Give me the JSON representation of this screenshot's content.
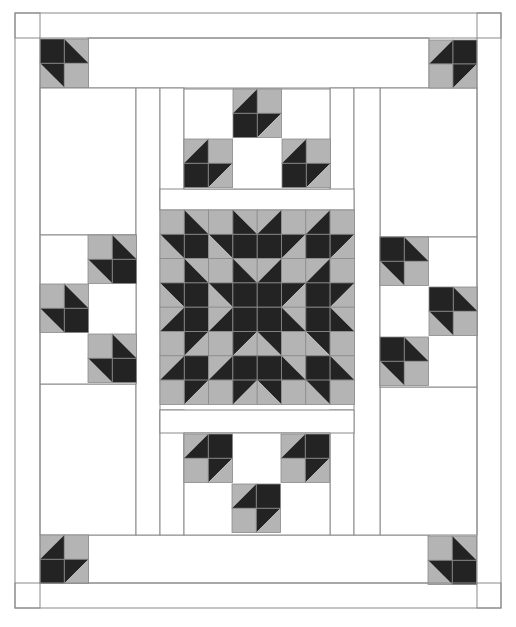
{
  "colors": {
    "background": "#ffffff",
    "fabric_light": "#ffffff",
    "fabric_gray": "#b4b4b4",
    "fabric_dark": "#232323",
    "seam_line": "#8a8a8a"
  },
  "cell_size": 24.3,
  "outline": {
    "outer_border": [
      15,
      13,
      486,
      595
    ],
    "inner_border": [
      40,
      38,
      437,
      545
    ]
  },
  "panels": [
    {
      "name": "top-sashing",
      "rect": [
        88,
        38,
        341,
        50
      ]
    },
    {
      "name": "bottom-sashing",
      "rect": [
        88,
        535,
        341,
        48
      ]
    },
    {
      "name": "left-top-panel",
      "rect": [
        40,
        88,
        96,
        147
      ]
    },
    {
      "name": "left-bottom-panel",
      "rect": [
        40,
        384,
        96,
        151
      ]
    },
    {
      "name": "right-top-panel",
      "rect": [
        380,
        88,
        97,
        149
      ]
    },
    {
      "name": "right-bottom-panel",
      "rect": [
        380,
        387,
        97,
        148
      ]
    },
    {
      "name": "left-strip-outer",
      "rect": [
        136,
        88,
        24,
        447
      ]
    },
    {
      "name": "left-strip-inner",
      "rect": [
        160,
        88,
        24,
        122
      ]
    },
    {
      "name": "left-strip-inner-bottom",
      "rect": [
        160,
        410,
        24,
        125
      ]
    },
    {
      "name": "right-strip-inner",
      "rect": [
        330,
        88,
        24,
        122
      ]
    },
    {
      "name": "right-strip-inner-bottom",
      "rect": [
        330,
        410,
        24,
        125
      ]
    },
    {
      "name": "right-strip-outer",
      "rect": [
        354,
        88,
        26,
        447
      ]
    },
    {
      "name": "top-center-strip",
      "rect": [
        160,
        189,
        194,
        21
      ]
    },
    {
      "name": "bottom-center-strip",
      "rect": [
        160,
        410,
        194,
        23
      ]
    },
    {
      "name": "top-center-field",
      "rect": [
        184,
        89,
        146,
        100
      ]
    },
    {
      "name": "bottom-center-field",
      "rect": [
        184,
        433,
        146,
        102
      ]
    },
    {
      "name": "left-center-field",
      "rect": [
        40,
        235,
        96,
        149
      ]
    },
    {
      "name": "right-center-field",
      "rect": [
        380,
        237,
        97,
        150
      ]
    },
    {
      "name": "left-corner-top",
      "rect": [
        15,
        13,
        25,
        25
      ]
    },
    {
      "name": "left-corner-bottom",
      "rect": [
        15,
        583,
        25,
        25
      ]
    },
    {
      "name": "right-corner-top",
      "rect": [
        477,
        13,
        24,
        25
      ]
    },
    {
      "name": "right-corner-bottom",
      "rect": [
        477,
        583,
        24,
        25
      ]
    }
  ],
  "bird_blocks": [
    {
      "name": "corner-top-left",
      "x": 40,
      "y": 39,
      "size": 24.3,
      "cells": [
        [
          "D",
          "LL"
        ],
        [
          "UR",
          "G"
        ]
      ]
    },
    {
      "name": "corner-top-right",
      "x": 429,
      "y": 40,
      "size": 24,
      "cells": [
        [
          "LRg",
          "D"
        ],
        [
          "G",
          "ULd"
        ]
      ]
    },
    {
      "name": "corner-bottom-left",
      "x": 40,
      "y": 535,
      "size": 24.3,
      "cells": [
        [
          "LRg",
          "G"
        ],
        [
          "D",
          "ULd"
        ]
      ]
    },
    {
      "name": "corner-bottom-right",
      "x": 428,
      "y": 536,
      "size": 24.3,
      "cells": [
        [
          "G",
          "LL"
        ],
        [
          "UR",
          "D"
        ]
      ]
    },
    {
      "name": "top-center-bird-1",
      "x": 233,
      "y": 89,
      "size": 24.3,
      "cells": [
        [
          "LRg",
          "G"
        ],
        [
          "D",
          "ULd"
        ]
      ]
    },
    {
      "name": "top-center-bird-2",
      "x": 184,
      "y": 139,
      "size": 24.3,
      "cells": [
        [
          "LRg",
          "G"
        ],
        [
          "D",
          "ULd"
        ]
      ]
    },
    {
      "name": "top-center-bird-3",
      "x": 282,
      "y": 139,
      "size": 24.3,
      "cells": [
        [
          "LRg",
          "G"
        ],
        [
          "D",
          "ULd"
        ]
      ]
    },
    {
      "name": "bottom-center-bird-1",
      "x": 184,
      "y": 434,
      "size": 24.3,
      "cells": [
        [
          "LRg",
          "D"
        ],
        [
          "G",
          "ULd"
        ]
      ]
    },
    {
      "name": "bottom-center-bird-2",
      "x": 281,
      "y": 434,
      "size": 24.3,
      "cells": [
        [
          "LRg",
          "D"
        ],
        [
          "G",
          "ULd"
        ]
      ]
    },
    {
      "name": "bottom-center-bird-3",
      "x": 232,
      "y": 484,
      "size": 24.3,
      "cells": [
        [
          "LRg",
          "D"
        ],
        [
          "G",
          "ULd"
        ]
      ]
    },
    {
      "name": "left-bird-1",
      "x": 88,
      "y": 235,
      "size": 24.3,
      "cells": [
        [
          "G",
          "LL"
        ],
        [
          "UR",
          "D"
        ]
      ]
    },
    {
      "name": "left-bird-2",
      "x": 40,
      "y": 284,
      "size": 24.3,
      "cells": [
        [
          "G",
          "LL"
        ],
        [
          "UR",
          "D"
        ]
      ]
    },
    {
      "name": "left-bird-3",
      "x": 88,
      "y": 334,
      "size": 24.3,
      "cells": [
        [
          "G",
          "LL"
        ],
        [
          "UR",
          "D"
        ]
      ]
    },
    {
      "name": "right-bird-1",
      "x": 380,
      "y": 237,
      "size": 24.3,
      "cells": [
        [
          "D",
          "LL"
        ],
        [
          "UR",
          "G"
        ]
      ]
    },
    {
      "name": "right-bird-2",
      "x": 429,
      "y": 287,
      "size": 24.3,
      "cells": [
        [
          "D",
          "LL"
        ],
        [
          "UR",
          "G"
        ]
      ]
    },
    {
      "name": "right-bird-3",
      "x": 380,
      "y": 337,
      "size": 24.3,
      "cells": [
        [
          "D",
          "LL"
        ],
        [
          "UR",
          "G"
        ]
      ]
    }
  ],
  "center_star": {
    "x": 160,
    "y": 210,
    "size": 24.3,
    "rows": 8,
    "cols": 8,
    "quadrant_top_left": [
      [
        "G",
        "LL",
        "G",
        "LL"
      ],
      [
        "UR",
        "D",
        "UR",
        "D"
      ],
      [
        "G",
        "LL",
        "G",
        "LL"
      ],
      [
        "UR",
        "D",
        "UR",
        "D"
      ]
    ]
  },
  "legend": {
    "G": "solid gray square",
    "D": "solid dark square",
    "LL": "half-square triangle, dark lower-left, gray upper-right",
    "UR": "half-square triangle, dark upper-right, gray lower-left",
    "LRg": "half-square triangle, gray upper-left, dark lower-right (diagonal bottom-left to top-right)",
    "ULd": "half-square triangle, dark upper-left, gray lower-right (diagonal bottom-left to top-right)"
  }
}
